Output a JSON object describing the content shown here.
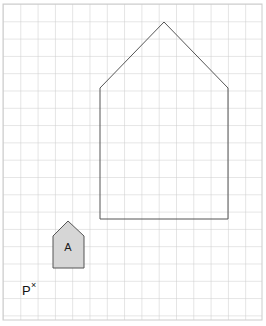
{
  "figure": {
    "background_color": "#ffffff",
    "width": 266,
    "height": 326
  },
  "grid": {
    "name": "square-grid",
    "line_color": "#cccccc",
    "cell_size_px": 17.3,
    "origin_x_px": 3,
    "origin_y_px": 4,
    "columns": 15,
    "rows": 18,
    "right_edge_px": 262,
    "bottom_edge_px": 320
  },
  "shapes": [
    {
      "id": "large-house",
      "name": "large-pentagon-outline",
      "label": "",
      "fill": "none",
      "stroke": "#555555",
      "stroke_width": 1,
      "points": "100,219 100,88 164,22 228,88 228,219",
      "vertices": [
        {
          "x": 100,
          "y": 219
        },
        {
          "x": 100,
          "y": 88
        },
        {
          "x": 164,
          "y": 22
        },
        {
          "x": 228,
          "y": 88
        },
        {
          "x": 228,
          "y": 219
        }
      ]
    },
    {
      "id": "small-house-a",
      "name": "small-pentagon-shaded",
      "label": "A",
      "fill": "#d6d6d6",
      "stroke": "#555555",
      "stroke_width": 1,
      "points": "53,268 53,236 68,221 84,236 84,268",
      "vertices": [
        {
          "x": 53,
          "y": 268
        },
        {
          "x": 53,
          "y": 236
        },
        {
          "x": 68,
          "y": 221
        },
        {
          "x": 84,
          "y": 236
        },
        {
          "x": 84,
          "y": 268
        }
      ],
      "label_x": 68,
      "label_y": 248
    }
  ],
  "annotations": {
    "point_p": {
      "name": "point-p-label",
      "letter": "P",
      "mark": "×",
      "letter_x": 22,
      "letter_y": 295,
      "mark_x": 31,
      "mark_y": 288,
      "color": "#111111"
    }
  }
}
